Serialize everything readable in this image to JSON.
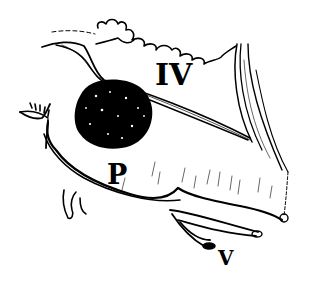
{
  "figure": {
    "type": "anatomical line drawing",
    "labels": {
      "iv": "IV",
      "p": "P",
      "v": "V"
    },
    "colors": {
      "ink": "#000000",
      "background": "#ffffff"
    }
  }
}
